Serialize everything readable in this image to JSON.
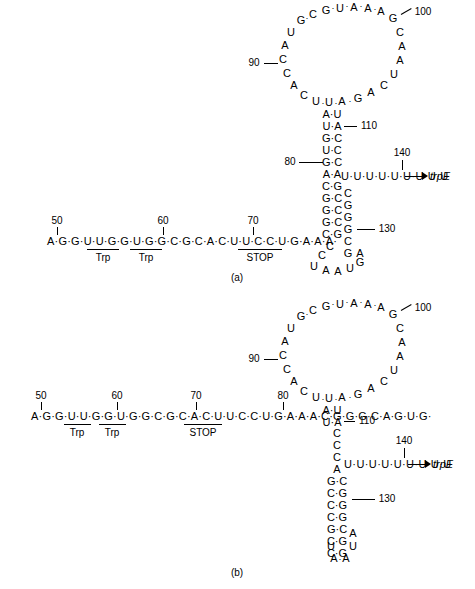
{
  "figure": {
    "panels": [
      {
        "id": "a",
        "caption": "(a)",
        "description": "Antiterminator / 2:3 pairing with 3:4 terminator hairpin",
        "leader_sequence": "A·G·G·U·U·G·G·U·G·G·C·G·C·A·C·U·U·C·C·U·G·A·A·A·",
        "gene_label": "trpE",
        "numbers": [
          "50",
          "60",
          "70",
          "80",
          "90",
          "100",
          "110",
          "130",
          "140"
        ],
        "feature_labels": [
          "Trp",
          "Trp",
          "STOP"
        ],
        "polyU": "U·U·U·U·U·U·U·U·U",
        "loop_top": [
          "G",
          "C",
          "G",
          "U",
          "A",
          "A",
          "A",
          "G"
        ],
        "loop_left": [
          "U",
          "A",
          "C",
          "C",
          "A",
          "C"
        ],
        "loop_bottom_left": [
          "U",
          "U",
          "A"
        ],
        "loop_bottom_right": [
          "G",
          "A",
          "C"
        ],
        "loop_right": [
          "C",
          "A",
          "A",
          "U"
        ],
        "stem_pairs": [
          [
            "A",
            "U"
          ],
          [
            "U",
            "A"
          ],
          [
            "G",
            "C"
          ],
          [
            "U",
            "C"
          ],
          [
            "G",
            "C"
          ],
          [
            "A",
            "A"
          ],
          [
            "C",
            "G"
          ],
          [
            "G",
            "C"
          ],
          [
            "G",
            "C"
          ],
          [
            "G",
            "C"
          ],
          [
            "C",
            "G"
          ]
        ],
        "hairpin_loop": [
          "C",
          "C",
          "U",
          "A",
          "A",
          "U"
        ],
        "right_arm": [
          "C",
          "G",
          "G",
          "G",
          "C",
          "G",
          "G",
          "A"
        ]
      },
      {
        "id": "b",
        "caption": "(b)",
        "description": "1:2 pairing leaving 3:4 terminator hairpin free",
        "leader_sequence": "A·G·G·U·U·G·G·U·G·G·C·G·C·A·C·U·U·C·C·U·G·A·A·A·C·G·G·G·C·A·G·U·G·",
        "gene_label": "trpE",
        "numbers": [
          "50",
          "60",
          "70",
          "80",
          "90",
          "100",
          "110",
          "130",
          "140"
        ],
        "feature_labels": [
          "Trp",
          "Trp",
          "STOP"
        ],
        "polyU": "U·U·U·U·U·U·U·U·U",
        "loop_top": [
          "G",
          "C",
          "G",
          "U",
          "A",
          "A",
          "A",
          "G"
        ],
        "loop_left": [
          "U",
          "A",
          "C",
          "C",
          "A",
          "C"
        ],
        "loop_bottom_left": [
          "U",
          "U",
          "A"
        ],
        "loop_bottom_right": [
          "G",
          "A",
          "C"
        ],
        "loop_right": [
          "C",
          "A",
          "A",
          "U"
        ],
        "upper_pairs": [
          [
            "A",
            "U"
          ],
          [
            "U",
            "A"
          ]
        ],
        "bulge": [
          "C",
          "C",
          "C"
        ],
        "term_pairs": [
          [
            "A",
            "U"
          ],
          [
            "G",
            "C"
          ],
          [
            "C",
            "G"
          ],
          [
            "C",
            "G"
          ],
          [
            "C",
            "G"
          ],
          [
            "G",
            "C"
          ],
          [
            "C",
            "G"
          ],
          [
            "C",
            "G"
          ]
        ],
        "term_loop": [
          "A",
          "U",
          "U",
          "A",
          "A"
        ]
      }
    ]
  }
}
